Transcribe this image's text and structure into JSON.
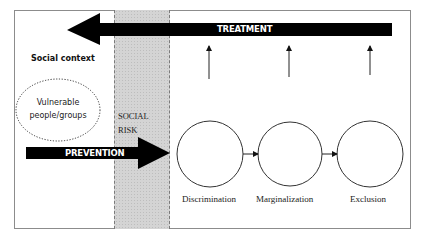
{
  "diagram": {
    "treatment_arrow": {
      "label": "TREATMENT",
      "direction": "left",
      "color": "#000000"
    },
    "prevention_arrow": {
      "label": "PREVENTION",
      "direction": "right",
      "color": "#000000"
    },
    "social_context": {
      "label": "Social context"
    },
    "vulnerable_group": {
      "line1": "Vulnerable",
      "line2": "people/groups"
    },
    "social_risk": {
      "line1": "SOCIAL",
      "line2": "RISK",
      "band_color": "#d4d4d4"
    },
    "stages": [
      {
        "label": "Discrimination"
      },
      {
        "label": "Marginalization"
      },
      {
        "label": "Exclusion"
      }
    ],
    "stage_connectors": 2,
    "treatment_up_arrows": 3
  }
}
